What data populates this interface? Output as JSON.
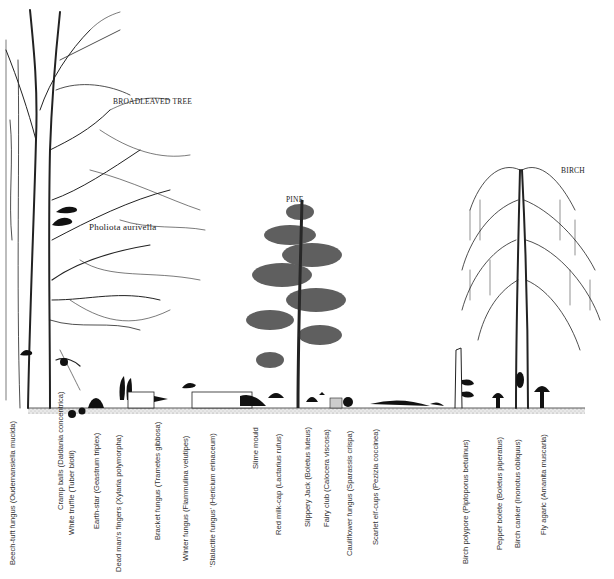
{
  "illustration": {
    "trees": {
      "broadleaved": "BROADLEAVED TREE",
      "pine": "PINE",
      "birch": "BIRCH"
    },
    "tree_annotations": {
      "pholiota": "Pholiota aurivella"
    },
    "species": [
      {
        "label": "Beech-tuft fungus (Oudemansiella mucida)",
        "x": 8,
        "bottom": 565
      },
      {
        "label": "Cramp balls (Daldania concentrica)",
        "x": 56,
        "bottom": 510
      },
      {
        "label": "White truffle (Tuber blotii)",
        "x": 67,
        "bottom": 535
      },
      {
        "label": "Earth-star (Geastrum triplex)",
        "x": 92,
        "bottom": 529
      },
      {
        "label": "Dead man's fingers (Xylaria polymorpha)",
        "x": 114,
        "bottom": 572
      },
      {
        "label": "Bracket fungus (Trametes gibbosa)",
        "x": 153,
        "bottom": 540
      },
      {
        "label": "Winter fungus (Flammulina velutipes)",
        "x": 181,
        "bottom": 561
      },
      {
        "label": "'Stalactite fungus' (Hericium erinaceum)",
        "x": 208,
        "bottom": 567
      },
      {
        "label": "Slime mould",
        "x": 251,
        "bottom": 469
      },
      {
        "label": "Red milk-cap (Lactarius rufus)",
        "x": 274,
        "bottom": 535
      },
      {
        "label": "Slippery Jack (Boletus luteus)",
        "x": 303,
        "bottom": 527
      },
      {
        "label": "Fairy club (Calocera viscosa)",
        "x": 322,
        "bottom": 527
      },
      {
        "label": "Cauliflower fungus (Sparassis crispa)",
        "x": 345,
        "bottom": 556
      },
      {
        "label": "Scarlet elf-cups (Pezizia coccinea)",
        "x": 371,
        "bottom": 545
      },
      {
        "label": "Birch polypore (Piptoporus betulinus)",
        "x": 461,
        "bottom": 564
      },
      {
        "label": "Pepper bolete (Boletus piperatus)",
        "x": 495,
        "bottom": 550
      },
      {
        "label": "Birch canker (Inonotus obliquus)",
        "x": 513,
        "bottom": 548
      },
      {
        "label": "Fly agaric (Amanita muscaria)",
        "x": 539,
        "bottom": 535
      }
    ]
  }
}
